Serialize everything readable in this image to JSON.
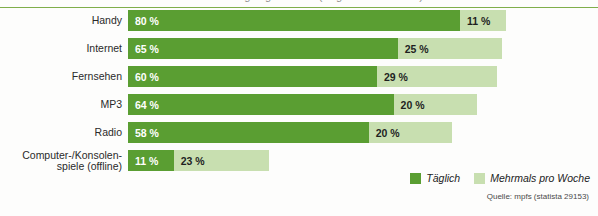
{
  "chart_data": {
    "type": "bar",
    "orientation": "horizontal",
    "stacked": true,
    "title": "",
    "xlabel": "",
    "ylabel": "",
    "categories": [
      "Handy",
      "Internet",
      "Fernsehen",
      "MP3",
      "Radio",
      "Computer-/Konsolen-\nspiele (offline)"
    ],
    "series": [
      {
        "name": "Täglich",
        "color": "#5a9e32",
        "values": [
          80,
          65,
          60,
          64,
          58,
          11
        ],
        "labels": [
          "80 %",
          "65 %",
          "60 %",
          "64 %",
          "58 %",
          "11 %"
        ]
      },
      {
        "name": "Mehrmals pro Woche",
        "color": "#c8dfb0",
        "values": [
          11,
          25,
          29,
          20,
          20,
          23
        ],
        "labels": [
          "11 %",
          "25 %",
          "29 %",
          "20 %",
          "20 %",
          "23 %"
        ]
      }
    ],
    "totals": [
      91,
      90,
      89,
      84,
      78,
      34
    ],
    "xlim": [
      0,
      91
    ],
    "grid": false,
    "unit": "%",
    "legend_position": "bottom-right"
  },
  "legend": {
    "items": [
      {
        "label": "Täglich",
        "color": "#5a9e32"
      },
      {
        "label": "Mehrmals pro Woche",
        "color": "#c8dfb0"
      }
    ]
  },
  "source": {
    "text": "Quelle: mpfs (statista 29153)"
  },
  "title_strip": {
    "text": "Mediennutzung Jugendlicher (Angaben in Prozent)"
  },
  "colors": {
    "daily": "#5a9e32",
    "weekly": "#c8dfb0",
    "rule": "#7fae4a",
    "background": "#fdfdfc",
    "label_text": "#2a2a2a"
  }
}
